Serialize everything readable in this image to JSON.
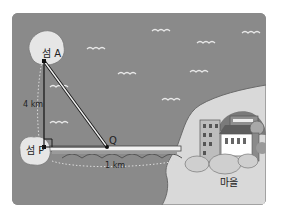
{
  "diagram": {
    "title": "",
    "labels": {
      "island_a": "섬 A",
      "island_p": "섬 P",
      "point_q": "Q",
      "distance_ap": "4 km",
      "distance_pq": "1 km",
      "village": "마을"
    },
    "colors": {
      "sea": "#8a8a8a",
      "land": "#d9d9d9",
      "island": "#e6e6e6",
      "line": "#111111",
      "bridge": "#f2f2f2"
    },
    "elements": [
      "island A",
      "island P",
      "point Q",
      "segment AP (4 km)",
      "segment AQ",
      "segment PQ (bridge, 1 km)",
      "right-angle mark at P",
      "village with buildings"
    ]
  }
}
